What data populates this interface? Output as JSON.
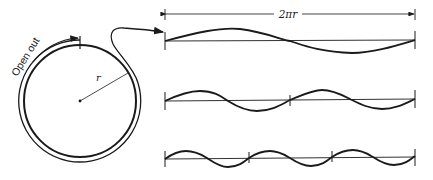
{
  "diagram": {
    "circle": {
      "radius_label": "r",
      "open_out_label": "Open out"
    },
    "dimension": {
      "label": "2πr"
    },
    "waves": [
      {
        "name": "one-wavelength",
        "cycles": 1
      },
      {
        "name": "two-wavelengths",
        "cycles": 2
      },
      {
        "name": "three-wavelengths",
        "cycles": 3
      }
    ],
    "colors": {
      "ink": "#1a1a1a",
      "background": "#ffffff"
    }
  }
}
